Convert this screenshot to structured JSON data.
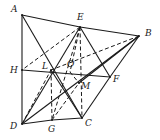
{
  "diagram": {
    "title": "",
    "points": {
      "A": {
        "label": "A",
        "x": 22,
        "y": 15,
        "lx": 11,
        "ly": 12
      },
      "E": {
        "label": "E",
        "x": 80,
        "y": 27,
        "lx": 77,
        "ly": 20
      },
      "B": {
        "label": "B",
        "x": 139,
        "y": 36,
        "lx": 145,
        "ly": 36
      },
      "H": {
        "label": "H",
        "x": 22,
        "y": 70,
        "lx": 10,
        "ly": 73
      },
      "L": {
        "label": "L",
        "x": 51,
        "y": 70,
        "lx": 42,
        "ly": 69
      },
      "O": {
        "label": "O",
        "x": 70,
        "y": 72,
        "lx": 67,
        "ly": 67
      },
      "F": {
        "label": "F",
        "x": 110,
        "y": 77,
        "lx": 113,
        "ly": 82
      },
      "M": {
        "label": "M",
        "x": 79,
        "y": 83,
        "lx": 81,
        "ly": 89
      },
      "D": {
        "label": "D",
        "x": 22,
        "y": 124,
        "lx": 10,
        "ly": 129
      },
      "G": {
        "label": "G",
        "x": 52,
        "y": 120,
        "lx": 48,
        "ly": 132
      },
      "C": {
        "label": "C",
        "x": 82,
        "y": 118,
        "lx": 85,
        "ly": 126
      }
    },
    "solid_segments": [
      [
        "A",
        "E"
      ],
      [
        "E",
        "B"
      ],
      [
        "B",
        "F"
      ],
      [
        "F",
        "C"
      ],
      [
        "C",
        "G"
      ],
      [
        "G",
        "D"
      ],
      [
        "D",
        "H"
      ],
      [
        "H",
        "A"
      ],
      [
        "A",
        "C"
      ],
      [
        "D",
        "B"
      ],
      [
        "H",
        "F"
      ],
      [
        "E",
        "D"
      ],
      [
        "E",
        "F"
      ],
      [
        "B",
        "M"
      ],
      [
        "L",
        "C"
      ]
    ],
    "dashed_segments": [
      [
        "E",
        "H"
      ],
      [
        "E",
        "G"
      ],
      [
        "E",
        "C"
      ],
      [
        "L",
        "G"
      ],
      [
        "D",
        "L"
      ],
      [
        "B",
        "L"
      ],
      [
        "G",
        "M"
      ],
      [
        "E",
        "O"
      ],
      [
        "O",
        "M"
      ]
    ]
  }
}
